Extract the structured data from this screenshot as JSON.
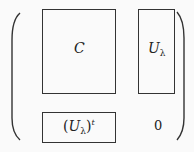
{
  "matrix": {
    "top_left": {
      "symbol": "C"
    },
    "top_right": {
      "symbol": "U",
      "subscript": "λ"
    },
    "bottom_left": {
      "open": "(",
      "symbol": "U",
      "subscript": "λ",
      "close": ")",
      "superscript": "t"
    },
    "bottom_right": {
      "value": "0"
    }
  }
}
